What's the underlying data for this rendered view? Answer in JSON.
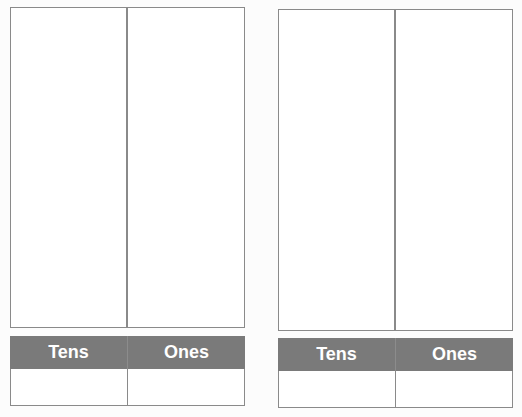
{
  "charts": [
    {
      "id": "left",
      "headers": {
        "tens": "Tens",
        "ones": "Ones"
      }
    },
    {
      "id": "right",
      "headers": {
        "tens": "Tens",
        "ones": "Ones"
      }
    }
  ],
  "colors": {
    "header_bg": "#7a7a7a",
    "border": "#8a8a8a",
    "header_text": "#ffffff"
  }
}
